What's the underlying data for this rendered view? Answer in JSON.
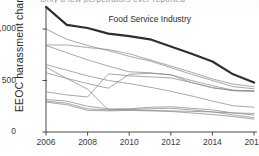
{
  "chart_data": {
    "type": "line",
    "title": "Only a few perpetrators ever reported",
    "title_clipped": true,
    "xlabel": "",
    "ylabel": "EEOC harassment charges",
    "x": [
      2006,
      2007,
      2008,
      2009,
      2010,
      2011,
      2012,
      2013,
      2014,
      2015,
      2016
    ],
    "xticks": [
      "2006",
      "2008",
      "2010",
      "2012",
      "2014",
      "2016"
    ],
    "xtick_values": [
      2006,
      2008,
      2010,
      2012,
      2014,
      2016
    ],
    "yticks": [
      "0",
      "500",
      "1,000"
    ],
    "ytick_values": [
      0,
      500,
      1000
    ],
    "xlim": [
      2006,
      2016
    ],
    "ylim": [
      0,
      1230
    ],
    "grid": false,
    "legend": "none",
    "annotations": [
      {
        "text": "Food Service Industry",
        "x": 2009.0,
        "y": 1085
      }
    ],
    "series": [
      {
        "name": "Food Service Industry",
        "highlight": true,
        "color": "#2f2f2f",
        "width": 2.2,
        "values": [
          1215,
          1040,
          1010,
          955,
          930,
          900,
          830,
          760,
          685,
          560,
          480
        ]
      },
      {
        "name": "Industry 2",
        "highlight": false,
        "color": "#8c8c8c",
        "width": 0.9,
        "values": [
          1000,
          900,
          840,
          790,
          735,
          690,
          625,
          560,
          500,
          440,
          420
        ]
      },
      {
        "name": "Industry 3",
        "highlight": false,
        "color": "#8c8c8c",
        "width": 0.9,
        "values": [
          845,
          845,
          820,
          800,
          760,
          700,
          640,
          580,
          515,
          465,
          440
        ]
      },
      {
        "name": "Industry 4",
        "highlight": false,
        "color": "#8c8c8c",
        "width": 0.9,
        "values": [
          840,
          770,
          700,
          640,
          585,
          575,
          555,
          500,
          450,
          405,
          395
        ]
      },
      {
        "name": "Industry 5",
        "highlight": false,
        "color": "#8c8c8c",
        "width": 0.9,
        "values": [
          655,
          600,
          545,
          500,
          470,
          435,
          395,
          350,
          300,
          255,
          240
        ]
      },
      {
        "name": "Industry 6",
        "highlight": false,
        "color": "#8c8c8c",
        "width": 0.9,
        "values": [
          575,
          520,
          470,
          425,
          560,
          570,
          555,
          480,
          430,
          405,
          400
        ]
      },
      {
        "name": "Industry 7",
        "highlight": false,
        "color": "#8c8c8c",
        "width": 0.9,
        "values": [
          390,
          360,
          340,
          565,
          545,
          535,
          525,
          480,
          430,
          400,
          395
        ]
      },
      {
        "name": "Industry 8",
        "highlight": false,
        "color": "#8c8c8c",
        "width": 0.9,
        "values": [
          630,
          520,
          415,
          215,
          215,
          210,
          205,
          200,
          195,
          185,
          180
        ]
      },
      {
        "name": "Industry 9",
        "highlight": false,
        "color": "#8c8c8c",
        "width": 0.9,
        "values": [
          315,
          300,
          250,
          225,
          225,
          240,
          245,
          230,
          215,
          185,
          165
        ]
      },
      {
        "name": "Industry 10",
        "highlight": false,
        "color": "#8c8c8c",
        "width": 0.9,
        "values": [
          300,
          280,
          225,
          215,
          220,
          225,
          230,
          215,
          195,
          165,
          140
        ]
      },
      {
        "name": "Industry 11",
        "highlight": false,
        "color": "#8c8c8c",
        "width": 0.9,
        "values": [
          290,
          265,
          210,
          205,
          210,
          205,
          200,
          185,
          170,
          150,
          125
        ]
      }
    ]
  },
  "axis": {
    "ylabel": "EEOC harassment charges"
  }
}
